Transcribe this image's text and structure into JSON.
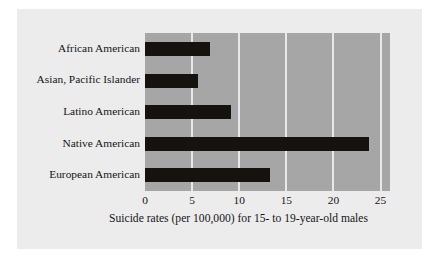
{
  "chart_data": {
    "type": "bar",
    "orientation": "horizontal",
    "title": "",
    "xlabel": "Suicide rates (per 100,000) for 15- to 19-year-old males",
    "ylabel": "",
    "categories": [
      "African American",
      "Asian, Pacific Islander",
      "Latino American",
      "Native American",
      "European American"
    ],
    "values": [
      6.9,
      5.6,
      9.1,
      23.8,
      13.3
    ],
    "xlim": [
      0,
      26
    ],
    "xticks": [
      0,
      5,
      10,
      15,
      20,
      25
    ],
    "xtick_labels": [
      "0",
      "5",
      "10",
      "15",
      "20",
      "25"
    ],
    "grid": "vertical",
    "legend": "none",
    "bar_color": "#16130f",
    "plot_background_color": "#a6a6a6",
    "gridline_color": "#e8e8e8",
    "figure_background_color": "#ececed"
  }
}
